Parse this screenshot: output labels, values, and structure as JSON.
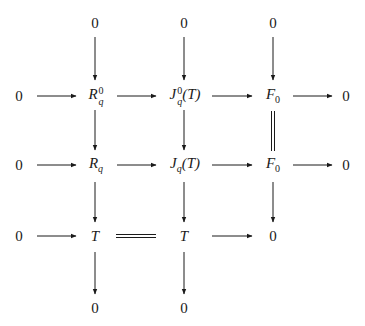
{
  "diagram": {
    "type": "commutative-diagram",
    "nodes": {
      "top_R": "0",
      "top_J": "0",
      "top_F": "0",
      "r1_left": "0",
      "r1_R_base": "R",
      "r1_R_sup": "0",
      "r1_R_sub": "q",
      "r1_J_base": "J",
      "r1_J_sup": "0",
      "r1_J_sub": "q",
      "r1_J_arg": "(T)",
      "r1_F_base": "F",
      "r1_F_sub": "0",
      "r1_right": "0",
      "r2_left": "0",
      "r2_R_base": "R",
      "r2_R_sub": "q",
      "r2_J_base": "J",
      "r2_J_sub": "q",
      "r2_J_arg": "(T)",
      "r2_F_base": "F",
      "r2_F_sub": "0",
      "r2_right": "0",
      "r3_left": "0",
      "r3_T1": "T",
      "r3_T2": "T",
      "r3_zero": "0",
      "bot_R": "0",
      "bot_J": "0"
    },
    "arrows": [
      {
        "from": "top_R",
        "to": "R_q^0",
        "style": "arrow"
      },
      {
        "from": "top_J",
        "to": "J_q^0(T)",
        "style": "arrow"
      },
      {
        "from": "top_F",
        "to": "F_0",
        "style": "arrow"
      },
      {
        "from": "0",
        "to": "R_q^0",
        "style": "arrow"
      },
      {
        "from": "R_q^0",
        "to": "J_q^0(T)",
        "style": "arrow"
      },
      {
        "from": "J_q^0(T)",
        "to": "F_0",
        "style": "arrow"
      },
      {
        "from": "F_0",
        "to": "0",
        "style": "arrow"
      },
      {
        "from": "R_q^0",
        "to": "R_q",
        "style": "arrow"
      },
      {
        "from": "J_q^0(T)",
        "to": "J_q(T)",
        "style": "arrow"
      },
      {
        "from": "F_0",
        "to": "F_0",
        "style": "double-line"
      },
      {
        "from": "0",
        "to": "R_q",
        "style": "arrow"
      },
      {
        "from": "R_q",
        "to": "J_q(T)",
        "style": "arrow"
      },
      {
        "from": "J_q(T)",
        "to": "F_0",
        "style": "arrow"
      },
      {
        "from": "F_0",
        "to": "0",
        "style": "arrow"
      },
      {
        "from": "R_q",
        "to": "T",
        "style": "arrow"
      },
      {
        "from": "J_q(T)",
        "to": "T",
        "style": "arrow"
      },
      {
        "from": "F_0",
        "to": "0",
        "style": "arrow"
      },
      {
        "from": "0",
        "to": "T",
        "style": "arrow"
      },
      {
        "from": "T",
        "to": "T",
        "style": "double-line"
      },
      {
        "from": "T",
        "to": "0",
        "style": "arrow"
      },
      {
        "from": "T",
        "to": "0 (bottom)",
        "style": "arrow"
      },
      {
        "from": "T",
        "to": "0 (bottom)",
        "style": "arrow"
      }
    ]
  }
}
